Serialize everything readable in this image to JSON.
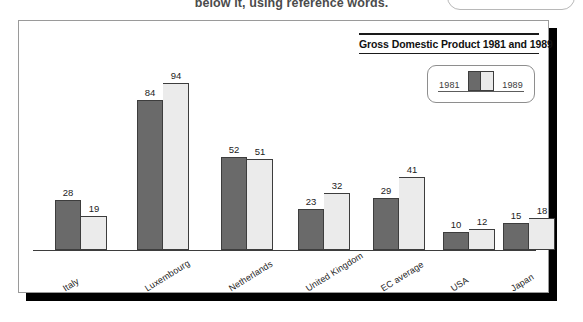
{
  "page": {
    "cutoff_text": "below it, using reference words."
  },
  "top_control": {
    "name": "rounded-pill-button",
    "label": ""
  },
  "chart_panel": {
    "title": "Gross Domestic Product 1981 and 1989",
    "legend": {
      "left_label": "1981",
      "right_label": "1989"
    }
  },
  "colors": {
    "bar_1981": "#6a6a6a",
    "bar_1989": "#ebebeb",
    "bar_outline": "#3d3d3d",
    "panel_border": "#9a9a9a",
    "shadow": "#000000",
    "text": "#1c1c1c"
  },
  "chart_data": {
    "type": "bar",
    "title": "Gross Domestic Product 1981 and 1989",
    "xlabel": "",
    "ylabel": "",
    "ylim": [
      0,
      100
    ],
    "grid": false,
    "legend_position": "top-right",
    "categories": [
      "Italy",
      "Luxembourg",
      "Netherlands",
      "United Kingdom",
      "EC average",
      "USA",
      "Japan"
    ],
    "series": [
      {
        "name": "1981",
        "values": [
          28,
          84,
          52,
          23,
          29,
          10,
          15
        ]
      },
      {
        "name": "1989",
        "values": [
          19,
          94,
          51,
          32,
          41,
          12,
          18
        ]
      }
    ]
  }
}
